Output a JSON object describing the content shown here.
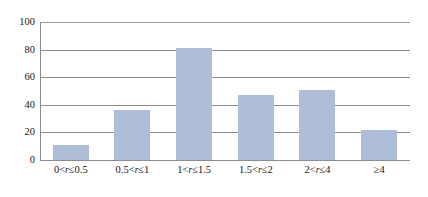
{
  "chart_data": {
    "type": "bar",
    "title": "",
    "subtitle": "",
    "xlabel": "",
    "ylabel": "",
    "categories": [
      "0<r≤0.5",
      "0.5<r≤1",
      "1<r≤1.5",
      "1.5<r≤2",
      "2<r≤4",
      "≥4"
    ],
    "category_parts": [
      {
        "pre": "0<",
        "var": "r",
        "post": "≤0.5"
      },
      {
        "pre": "0.5<",
        "var": "r",
        "post": "≤1"
      },
      {
        "pre": "1<",
        "var": "r",
        "post": "≤1.5"
      },
      {
        "pre": "1.5<",
        "var": "r",
        "post": "≤2"
      },
      {
        "pre": "2<",
        "var": "r",
        "post": "≤4"
      },
      {
        "pre": "≥4",
        "var": "",
        "post": ""
      }
    ],
    "values": [
      11,
      36,
      81,
      47,
      51,
      22
    ],
    "ylim": [
      0,
      100
    ],
    "yticks": [
      0,
      20,
      40,
      60,
      80,
      100
    ],
    "ytick_labels": [
      "0",
      "20",
      "40",
      "60",
      "80",
      "100"
    ],
    "grid": true,
    "legend": false,
    "legend_position": "none",
    "bar_color": "#aebdd8",
    "gridline_color": "#8d8d8d",
    "background_color": "#ffffff",
    "text_color": "#161616"
  }
}
